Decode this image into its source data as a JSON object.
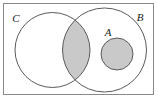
{
  "figure": {
    "kind": "venn-diagram",
    "width": 158,
    "height": 99,
    "background_color": "#ffffff"
  },
  "frame": {
    "name": "outer-border",
    "x": 3.5,
    "y": 3.5,
    "width": 150,
    "height": 91,
    "stroke_color": "#8a8a8a",
    "stroke_width": 1,
    "fill": "none"
  },
  "palette": {
    "shading_gray": "#c9c9c9",
    "outline_gray": "#5a5a5a",
    "frame_gray": "#8a8a8a",
    "label_black": "#1a1a1a",
    "region_white": "#ffffff"
  },
  "sets": [
    {
      "id": "C",
      "label": "C",
      "cx": 52.5,
      "cy": 50,
      "r": 37.5,
      "fill": "#ffffff",
      "stroke": "#5a5a5a",
      "label_x": 16,
      "label_y": 22
    },
    {
      "id": "B",
      "label": "B",
      "cx": 104.5,
      "cy": 50,
      "r": 42,
      "fill": "#ffffff",
      "stroke": "#5a5a5a",
      "label_x": 140,
      "label_y": 21
    },
    {
      "id": "A",
      "label": "A",
      "cx": 117,
      "cy": 54,
      "r": 16,
      "fill": "#c9c9c9",
      "stroke": "#5a5a5a",
      "label_x": 108,
      "label_y": 36
    }
  ],
  "shaded_regions": [
    {
      "id": "C-intersect-B",
      "description": "lens-shaped intersection of C and B",
      "fill": "#c9c9c9"
    },
    {
      "id": "A-disc",
      "description": "small circle A interior, inside B only",
      "fill": "#c9c9c9"
    }
  ]
}
